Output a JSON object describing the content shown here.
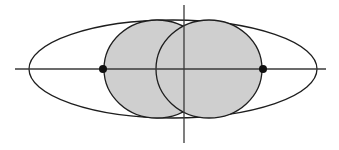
{
  "diagram": {
    "colors": {
      "background": "#ffffff",
      "disk_fill": "#cfcfcf",
      "stroke": "#1e1e1e",
      "axis": "#3a3a3a",
      "point": "#111111"
    },
    "horizontal_axis": {
      "x1": 15,
      "x2": 326,
      "y": 69
    },
    "vertical_axis": {
      "x": 184,
      "y1": 5,
      "y2": 143
    },
    "outer_ellipse": {
      "cx": 173,
      "cy": 69,
      "rx": 144,
      "ry": 49
    },
    "disks": [
      {
        "name": "left-disk",
        "cx": 157,
        "cy": 69,
        "rx": 53,
        "ry": 49
      },
      {
        "name": "right-disk",
        "cx": 209,
        "cy": 69,
        "rx": 53,
        "ry": 49
      }
    ],
    "points": [
      {
        "name": "left-point",
        "cx": 103,
        "cy": 69,
        "r": 4
      },
      {
        "name": "right-point",
        "cx": 263,
        "cy": 69,
        "r": 4
      }
    ]
  }
}
